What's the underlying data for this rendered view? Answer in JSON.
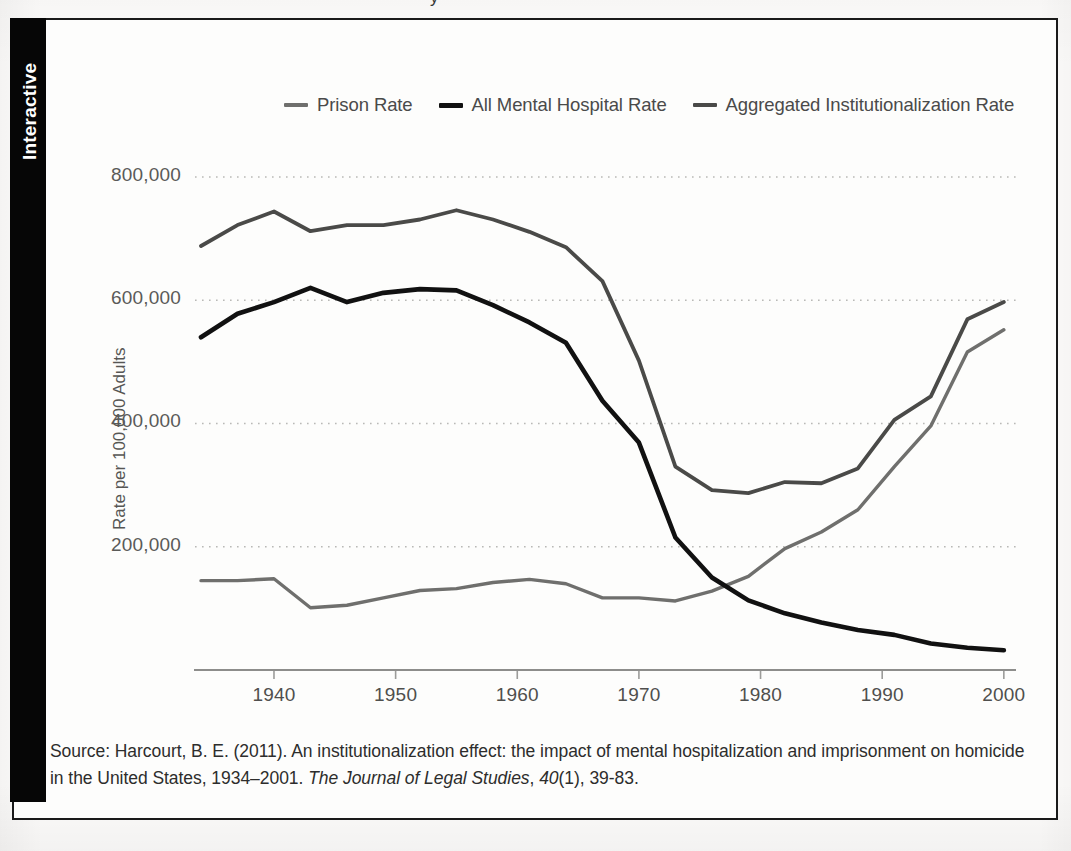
{
  "tab": {
    "label": "Interactive"
  },
  "top_clipped_text": "y",
  "legend": {
    "items": [
      {
        "label": "Prison Rate",
        "color": "#6f6f6d",
        "key": "prison"
      },
      {
        "label": "All Mental Hospital Rate",
        "color": "#111111",
        "key": "mental"
      },
      {
        "label": "Aggregated Institutionalization Rate",
        "color": "#4a4a48",
        "key": "aggregated"
      }
    ]
  },
  "axes": {
    "y_title": "Rate per 100,000 Adults",
    "y_ticks": [
      "200,000",
      "400,000",
      "600,000",
      "800,000"
    ],
    "x_ticks": [
      "1940",
      "1950",
      "1960",
      "1970",
      "1980",
      "1990",
      "2000"
    ]
  },
  "source": {
    "line1_a": "Source: Harcourt, B. E. (2011). An institutionalization effect: the impact of mental hospitalization and imprisonment",
    "line2_a": "on homicide in the United States, 1934–2001. ",
    "line2_italic1": "The Journal of Legal Studies",
    "line2_b": ", ",
    "line2_italic2": "40",
    "line2_c": "(1), 39-83."
  },
  "chart_data": {
    "type": "line",
    "title": "",
    "xlabel": "",
    "ylabel": "Rate per 100,000 Adults",
    "xlim": [
      1934,
      2001
    ],
    "ylim": [
      0,
      860000
    ],
    "ytick_values": [
      200000,
      400000,
      600000,
      800000
    ],
    "xtick_values": [
      1940,
      1950,
      1960,
      1970,
      1980,
      1990,
      2000
    ],
    "grid": "horizontal-dotted",
    "legend_position": "top-center",
    "x": [
      1934,
      1937,
      1940,
      1943,
      1946,
      1949,
      1952,
      1955,
      1958,
      1961,
      1964,
      1967,
      1970,
      1973,
      1976,
      1979,
      1982,
      1985,
      1988,
      1991,
      1994,
      1997,
      2000
    ],
    "series": [
      {
        "name": "Prison Rate",
        "color": "#6f6f6d",
        "values": [
          145000,
          145000,
          148000,
          101000,
          105000,
          117000,
          129000,
          132000,
          142000,
          147000,
          140000,
          117000,
          117000,
          112000,
          128000,
          152000,
          197000,
          224000,
          260000,
          330000,
          396000,
          516000,
          552000
        ]
      },
      {
        "name": "All Mental Hospital Rate",
        "color": "#111111",
        "values": [
          540000,
          578000,
          597000,
          620000,
          597000,
          612000,
          618000,
          616000,
          592000,
          564000,
          531000,
          437000,
          369000,
          215000,
          150000,
          113000,
          92000,
          77000,
          65000,
          57000,
          43000,
          36000,
          32000
        ]
      },
      {
        "name": "Aggregated Institutionalization Rate",
        "color": "#4a4a48",
        "values": [
          688000,
          722000,
          744000,
          712000,
          722000,
          722000,
          731000,
          746000,
          731000,
          711000,
          686000,
          631000,
          502000,
          330000,
          292000,
          287000,
          305000,
          303000,
          327000,
          406000,
          444000,
          569000,
          597000
        ]
      }
    ]
  }
}
